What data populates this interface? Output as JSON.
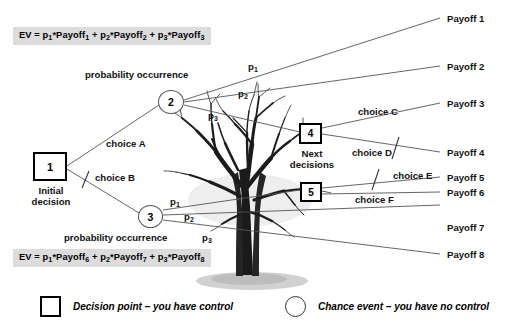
{
  "diagram": {
    "formulas": {
      "top_prefix": "EV = p",
      "top": "EV = p1*Payoff1 + p2*Payoff2 + p3*Payoff3",
      "bottom": "EV = p6*Payoff6 + p7*Payoff7 + p8*Payoff8"
    },
    "formula_top_parts": {
      "ev": "EV = p",
      "s1": "1",
      "t1": "*Payoff",
      "s2": "1",
      "plus1": " + p",
      "s3": "2",
      "t2": "*Payoff",
      "s4": "2",
      "plus2": " + p",
      "s5": "3",
      "t3": "*Payoff",
      "s6": "3"
    },
    "formula_bottom_parts": {
      "ev": "EV = p",
      "s1": "1",
      "t1": "*Payoff",
      "s2": "6",
      "plus1": " + p",
      "s3": "2",
      "t2": "*Payoff",
      "s4": "7",
      "plus2": " + p",
      "s5": "3",
      "t3": "*Payoff",
      "s6": "8"
    },
    "nodes": [
      {
        "id": "1",
        "label": "1",
        "shape": "square",
        "caption": "Initial decision"
      },
      {
        "id": "2",
        "label": "2",
        "shape": "circle",
        "caption": ""
      },
      {
        "id": "3",
        "label": "3",
        "shape": "circle",
        "caption": ""
      },
      {
        "id": "4",
        "label": "4",
        "shape": "square",
        "caption": "Next decisions"
      },
      {
        "id": "5",
        "label": "5",
        "shape": "square",
        "caption": ""
      }
    ],
    "captions": {
      "initial_decision_line1": "Initial",
      "initial_decision_line2": "decision",
      "next_decisions_line1": "Next",
      "next_decisions_line2": "decisions"
    },
    "annotations": {
      "probability_occurrence_top": "probability occurrence",
      "probability_occurrence_bottom": "probability occurrence"
    },
    "choices": [
      {
        "id": "A",
        "label": "choice A",
        "rejected": false
      },
      {
        "id": "B",
        "label": "choice B",
        "rejected": true
      },
      {
        "id": "C",
        "label": "choice C",
        "rejected": false
      },
      {
        "id": "D",
        "label": "choice D",
        "rejected": true
      },
      {
        "id": "E",
        "label": "choice E",
        "rejected": true
      },
      {
        "id": "F",
        "label": "choice F",
        "rejected": false
      }
    ],
    "probabilities_top": [
      {
        "symbol": "p",
        "sub": "1"
      },
      {
        "symbol": "p",
        "sub": "2"
      },
      {
        "symbol": "p",
        "sub": "3"
      }
    ],
    "probabilities_bottom": [
      {
        "symbol": "p",
        "sub": "1"
      },
      {
        "symbol": "p",
        "sub": "2"
      },
      {
        "symbol": "p",
        "sub": "3"
      }
    ],
    "payoffs": [
      "Payoff 1",
      "Payoff 2",
      "Payoff 3",
      "Payoff 4",
      "Payoff 5",
      "Payoff 6",
      "Payoff 7",
      "Payoff 8"
    ],
    "legend": [
      {
        "glyph": "square",
        "text": "Decision point – you have control"
      },
      {
        "glyph": "circle",
        "text": "Chance event – you have no control"
      }
    ],
    "illustration": {
      "name": "bare-tree-illustration"
    },
    "colors": {
      "formula_background": "#dcdcdc",
      "line": "#555555",
      "text": "#111111",
      "node_border": "#000000",
      "background": "#ffffff"
    }
  }
}
